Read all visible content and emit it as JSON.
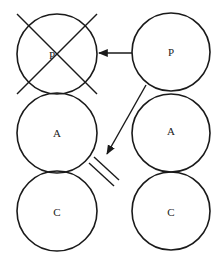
{
  "diagram": {
    "type": "node-diagram",
    "colors": {
      "stroke": "#1a1a1a",
      "text": "#222222",
      "background": "#ffffff"
    },
    "columns": [
      {
        "id": "left",
        "nodes": [
          {
            "id": "left-p",
            "label": "P",
            "cx": 57,
            "cy": 54,
            "r": 40,
            "crossed_out": true
          },
          {
            "id": "left-a",
            "label": "A",
            "cx": 57,
            "cy": 133,
            "r": 40,
            "crossed_out": false
          },
          {
            "id": "left-c",
            "label": "C",
            "cx": 57,
            "cy": 211,
            "r": 40,
            "crossed_out": false
          }
        ]
      },
      {
        "id": "right",
        "nodes": [
          {
            "id": "right-p",
            "label": "P",
            "cx": 171,
            "cy": 52,
            "r": 39,
            "crossed_out": false
          },
          {
            "id": "right-a",
            "label": "A",
            "cx": 171,
            "cy": 133,
            "r": 39,
            "crossed_out": false
          },
          {
            "id": "right-c",
            "label": "C",
            "cx": 171,
            "cy": 211,
            "r": 39,
            "crossed_out": false
          }
        ]
      }
    ],
    "edges": [
      {
        "id": "right-p-to-left-p",
        "from": "right-p",
        "to": "left-p",
        "arrow": "end",
        "blocked": false
      },
      {
        "id": "right-p-to-left-a",
        "from": "right-p",
        "to": "left-a",
        "arrow": "end",
        "blocked": true,
        "blocker": "double-line"
      }
    ],
    "annotations": [
      {
        "id": "cross-out-left-p",
        "type": "X",
        "target": "left-p"
      }
    ]
  }
}
